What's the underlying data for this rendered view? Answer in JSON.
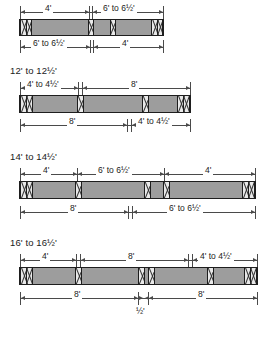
{
  "diagram": {
    "bar_fill_color": "#9d9d9d",
    "block_fill_color": "#e9e9e9",
    "line_color": "#4a4a4a",
    "outline_color": "#1e1e1e",
    "groups": [
      {
        "name": "group-10ft",
        "title": "",
        "title_visible": false,
        "top_dims": [
          {
            "label": "4'"
          },
          {
            "label": "6' to 6½'"
          }
        ],
        "bottom_dims": [
          {
            "label": "6' to 6½'"
          },
          {
            "label": "4'"
          }
        ],
        "blocks": [
          "double",
          "single",
          "single",
          "double"
        ]
      },
      {
        "name": "group-12ft",
        "title": "12' to 12½'",
        "title_visible": true,
        "top_dims": [
          {
            "label": "4' to 4½'"
          },
          {
            "label": "8'"
          }
        ],
        "bottom_dims": [
          {
            "label": "8'"
          },
          {
            "label": "4' to 4½'"
          }
        ],
        "blocks": [
          "double",
          "single",
          "single",
          "double"
        ]
      },
      {
        "name": "group-14ft",
        "title": "14' to 14½'",
        "title_visible": true,
        "top_dims": [
          {
            "label": "4'"
          },
          {
            "label": "6' to 6½'"
          },
          {
            "label": "4'"
          }
        ],
        "bottom_dims": [
          {
            "label": "8'"
          },
          {
            "label": "6' to 6½'"
          }
        ],
        "blocks": [
          "double",
          "single",
          "single",
          "single",
          "double"
        ]
      },
      {
        "name": "group-16ft",
        "title": "16' to 16½'",
        "title_visible": true,
        "top_dims": [
          {
            "label": "4'"
          },
          {
            "label": "8'"
          },
          {
            "label": "4' to 4½'"
          }
        ],
        "bottom_dims": [
          {
            "label": "8'"
          },
          {
            "label": "8'"
          }
        ],
        "gap_note": "½'",
        "blocks": [
          "double",
          "single",
          "single",
          "single",
          "single",
          "double"
        ]
      }
    ]
  }
}
